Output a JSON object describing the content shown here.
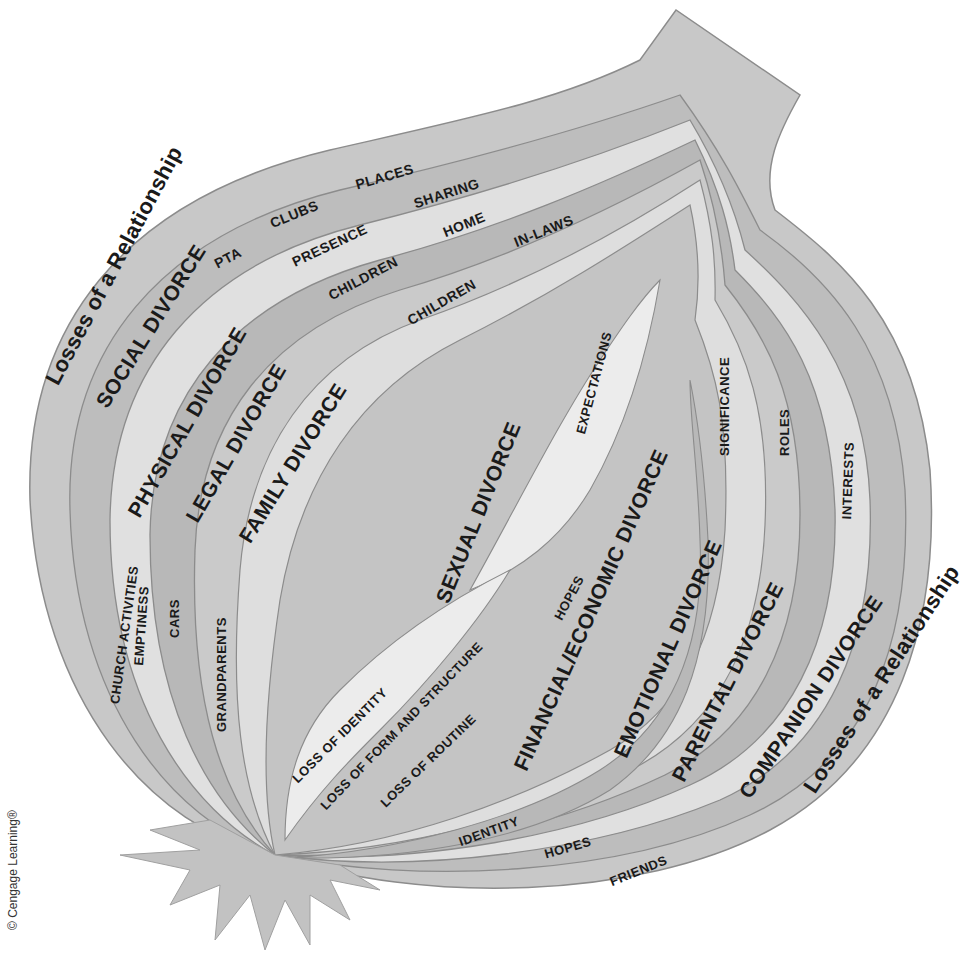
{
  "diagram": {
    "title": "Losses of a Relationship",
    "outer_label_left": "Losses of a Relationship",
    "outer_label_right": "Losses of a Relationship",
    "layers": [
      {
        "name": "SOCIAL DIVORCE",
        "items": [
          "PTA",
          "CLUBS",
          "PLACES",
          "CHURCH ACTIVITIES"
        ]
      },
      {
        "name": "PHYSICAL DIVORCE",
        "items": [
          "PRESENCE",
          "SHARING",
          "EMPTINESS"
        ]
      },
      {
        "name": "LEGAL DIVORCE",
        "items": [
          "CHILDREN",
          "HOME",
          "CARS"
        ]
      },
      {
        "name": "FAMILY DIVORCE",
        "items": [
          "CHILDREN",
          "IN-LAWS",
          "GRANDPARENTS"
        ]
      },
      {
        "name": "SEXUAL DIVORCE",
        "items": [
          "EXPECTATIONS"
        ]
      },
      {
        "name": "FINANCIAL/ECONOMIC DIVORCE",
        "items": [
          "HOPES",
          "IDENTITY"
        ]
      },
      {
        "name": "EMOTIONAL DIVORCE",
        "items": [
          "SIGNIFICANCE",
          "HOPES"
        ]
      },
      {
        "name": "PARENTAL DIVORCE",
        "items": [
          "ROLES"
        ]
      },
      {
        "name": "COMPANION DIVORCE",
        "items": [
          "INTERESTS",
          "FRIENDS"
        ]
      }
    ],
    "core_items": [
      "LOSS OF IDENTITY",
      "LOSS OF FORM AND STRUCTURE",
      "LOSS OF ROUTINE"
    ],
    "credit": "© Cengage Learning®"
  },
  "labels": {
    "rel_left": "Losses of a Relationship",
    "rel_right": "Losses of a Relationship",
    "social": "SOCIAL DIVORCE",
    "physical": "PHYSICAL DIVORCE",
    "legal": "LEGAL DIVORCE",
    "family": "FAMILY DIVORCE",
    "sexual": "SEXUAL DIVORCE",
    "financial": "FINANCIAL/ECONOMIC DIVORCE",
    "emotional": "EMOTIONAL DIVORCE",
    "parental": "PARENTAL DIVORCE",
    "companion": "COMPANION DIVORCE",
    "pta": "PTA",
    "clubs": "CLUBS",
    "places": "PLACES",
    "presence": "PRESENCE",
    "sharing": "SHARING",
    "children1": "CHILDREN",
    "home": "HOME",
    "children2": "CHILDREN",
    "inlaws": "IN-LAWS",
    "church": "CHURCH ACTIVITIES",
    "emptiness": "EMPTINESS",
    "cars": "CARS",
    "grandparents": "GRANDPARENTS",
    "expectations": "EXPECTATIONS",
    "significance": "SIGNIFICANCE",
    "roles": "ROLES",
    "interests": "INTERESTS",
    "hopes1": "HOPES",
    "loss_identity": "LOSS OF IDENTITY",
    "loss_form": "LOSS OF FORM AND STRUCTURE",
    "loss_routine": "LOSS OF ROUTINE",
    "identity": "IDENTITY",
    "hopes2": "HOPES",
    "friends": "FRIENDS",
    "credit": "© Cengage Learning®"
  },
  "colors": {
    "background": "#ffffff",
    "layer_dark": "#b4b4b4",
    "layer_mid": "#c6c6c6",
    "layer_light": "#e2e2e2",
    "outline": "#8c8c8c",
    "text": "#1a1a1a"
  }
}
